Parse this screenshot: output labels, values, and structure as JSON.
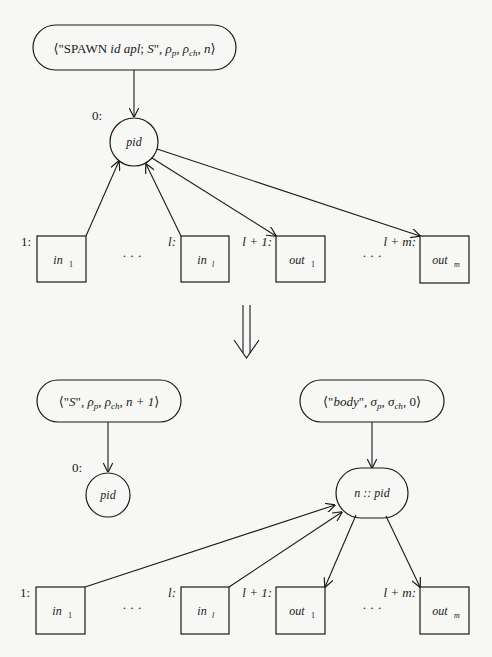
{
  "diagram": {
    "type": "graph-rewrite-rule",
    "colors": {
      "stroke": "#1a1a1a",
      "background": "#f7f7f5"
    },
    "before": {
      "pill": {
        "parts": [
          "⟨\"SPAWN ",
          "id apl",
          "; ",
          "S",
          "\", ",
          "ρ",
          "p",
          ", ",
          "ρ",
          "ch",
          ", ",
          "n",
          "⟩"
        ]
      },
      "center": {
        "label": "pid",
        "index_label": "0:"
      },
      "inputs": [
        {
          "index_label": "1:",
          "name": "in",
          "sub": "1"
        },
        {
          "index_label": "l:",
          "name": "in",
          "sub": "l"
        }
      ],
      "outputs": [
        {
          "index_label": "l + 1:",
          "name": "out",
          "sub": "1"
        },
        {
          "index_label": "l + m:",
          "name": "out",
          "sub": "m"
        }
      ],
      "ellipsis": "· · ·"
    },
    "transition_arrow": "⇓",
    "after": {
      "left_pill": {
        "parts": [
          "⟨\"",
          "S",
          "\", ",
          "ρ",
          "p",
          ", ",
          "ρ",
          "ch",
          ", ",
          "n + 1",
          "⟩"
        ]
      },
      "left_node": {
        "label": "pid",
        "index_label": "0:"
      },
      "right_pill": {
        "parts": [
          "⟨\"",
          "body",
          "\", ",
          "σ",
          "p",
          ", ",
          "σ",
          "ch",
          ", 0⟩"
        ]
      },
      "right_node": {
        "label": "n :: pid"
      },
      "inputs": [
        {
          "index_label": "1:",
          "name": "in",
          "sub": "1"
        },
        {
          "index_label": "l:",
          "name": "in",
          "sub": "l"
        }
      ],
      "outputs": [
        {
          "index_label": "l + 1:",
          "name": "out",
          "sub": "1"
        },
        {
          "index_label": "l + m:",
          "name": "out",
          "sub": "m"
        }
      ],
      "ellipsis": "· · ·"
    }
  }
}
